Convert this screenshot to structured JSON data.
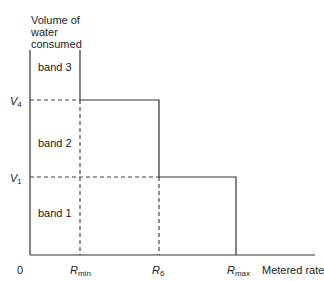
{
  "diagram": {
    "y_axis_label": [
      "Volume of",
      "water",
      "consumed"
    ],
    "x_axis_label": "Metered rate",
    "origin_label": "0",
    "y_ticks": [
      {
        "main": "V",
        "sub": "4"
      },
      {
        "main": "V",
        "sub": "1"
      }
    ],
    "x_ticks": [
      {
        "main": "R",
        "sub": "min"
      },
      {
        "main": "R",
        "sub": "6"
      },
      {
        "main": "R",
        "sub": "max"
      }
    ],
    "bands": [
      "band 3",
      "band 2",
      "band 1"
    ],
    "colors": {
      "line": "#333333",
      "dash": "#444444"
    }
  }
}
